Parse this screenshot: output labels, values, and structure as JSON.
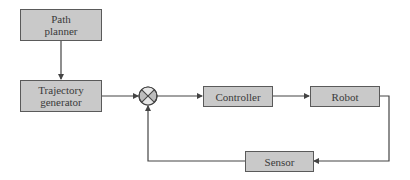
{
  "diagram": {
    "type": "block-diagram",
    "title": "",
    "colors": {
      "block_fill": "#c9c9c9",
      "block_border": "#5a5a5a",
      "line": "#444444",
      "text": "#3a3a3a"
    },
    "blocks": {
      "path_planner": {
        "line1": "Path",
        "line2": "planner"
      },
      "trajectory_generator": {
        "line1": "Trajectory",
        "line2": "generator"
      },
      "controller": {
        "label": "Controller"
      },
      "robot": {
        "label": "Robot"
      },
      "sensor": {
        "label": "Sensor"
      }
    },
    "junctions": [
      {
        "id": "summing_junction",
        "symbol": "circle-x"
      }
    ],
    "edges": [
      {
        "from": "Path planner",
        "to": "Trajectory generator"
      },
      {
        "from": "Trajectory generator",
        "to": "summing_junction"
      },
      {
        "from": "summing_junction",
        "to": "Controller"
      },
      {
        "from": "Controller",
        "to": "Robot"
      },
      {
        "from": "Robot",
        "to": "Sensor"
      },
      {
        "from": "Sensor",
        "to": "summing_junction"
      }
    ]
  }
}
